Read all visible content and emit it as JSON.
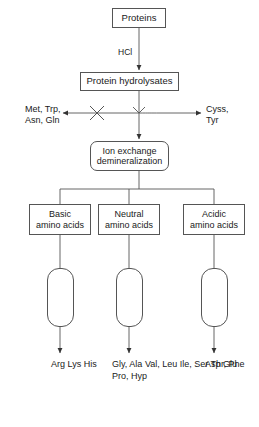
{
  "diagram": {
    "stroke_color": "#555555",
    "text_color": "#1a1a1a",
    "background": "#ffffff"
  },
  "nodes": {
    "proteins": {
      "label": "Proteins"
    },
    "hydrolysates": {
      "label": "Protein hydrolysates"
    },
    "ion_exchange": {
      "line1": "Ion exchange",
      "line2": "demineralization"
    },
    "basic": {
      "line1": "Basic",
      "line2": "amino acids"
    },
    "neutral": {
      "line1": "Neutral",
      "line2": "amino acids"
    },
    "acidic": {
      "line1": "Acidic",
      "line2": "amino acids"
    }
  },
  "edges": {
    "hcl_label": "HCl",
    "lost_amino_acids": {
      "line1": "Met, Trp,",
      "line2": "Asn, Gln"
    },
    "retained_amino_acids": {
      "line1": "Cyss,",
      "line2": "Tyr"
    }
  },
  "outputs": {
    "basic": {
      "line1": "Arg",
      "line2": "Lys",
      "line3": "His"
    },
    "neutral": {
      "line1": "Gly, Ala",
      "line2": "Val, Leu",
      "line3": "Ile, Ser",
      "line4": "Thr, Phe",
      "line5": "Pro, Hyp"
    },
    "acidic": {
      "line1": "Asp",
      "line2": "Glu"
    }
  }
}
